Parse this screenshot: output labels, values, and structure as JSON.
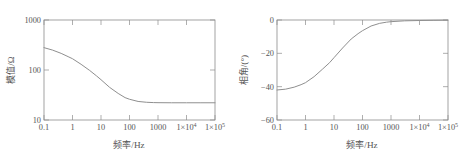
{
  "figure": {
    "background_color": "#ffffff",
    "line_color": "#8f8f8f",
    "axis_color": "#8c8c8c",
    "text_color": "#555555"
  },
  "panels": [
    {
      "id": "magnitude",
      "xlabel_cjk": "频率",
      "xlabel_unit": "/Hz",
      "ylabel_cjk": "模值",
      "ylabel_unit": "/Ω",
      "x_ticks": [
        "0.1",
        "1",
        "10",
        "100",
        "1000",
        "1×10",
        "1×10"
      ],
      "x_tick_sups": [
        "",
        "",
        "",
        "",
        "",
        "4",
        "5"
      ],
      "y_ticks": [
        "1000",
        "100",
        "10"
      ]
    },
    {
      "id": "phase",
      "xlabel_cjk": "频率",
      "xlabel_unit": "/Hz",
      "ylabel_cjk": "相角",
      "ylabel_unit": "/(°)",
      "x_ticks": [
        "0.1",
        "1",
        "10",
        "100",
        "1000",
        "1×10",
        "1×10"
      ],
      "x_tick_sups": [
        "",
        "",
        "",
        "",
        "",
        "4",
        "5"
      ],
      "y_ticks": [
        "0",
        "−20",
        "−40",
        "−60"
      ]
    }
  ],
  "chart_data": [
    {
      "type": "line",
      "id": "magnitude-bode",
      "title": "",
      "xlabel": "频率/Hz",
      "ylabel": "模值/Ω",
      "xscale": "log",
      "yscale": "log",
      "xlim": [
        0.1,
        100000
      ],
      "ylim": [
        10,
        1000
      ],
      "xticks": [
        0.1,
        1,
        10,
        100,
        1000,
        10000,
        100000
      ],
      "xticklabels": [
        "0.1",
        "1",
        "10",
        "100",
        "1000",
        "1×10⁴",
        "1×10⁵"
      ],
      "yticks": [
        10,
        100,
        1000
      ],
      "yticklabels": [
        "10",
        "100",
        "10"
      ],
      "grid": false,
      "legend": null,
      "x": [
        0.1,
        0.2,
        0.4,
        0.7,
        1,
        2,
        4,
        7,
        10,
        20,
        40,
        70,
        100,
        200,
        400,
        700,
        1000,
        3000,
        10000,
        30000,
        100000
      ],
      "y": [
        280,
        250,
        215,
        185,
        168,
        130,
        98,
        76,
        64,
        45,
        34,
        28,
        26,
        23.5,
        22.6,
        22.3,
        22.2,
        22.1,
        22.1,
        22.1,
        22.1
      ]
    },
    {
      "type": "line",
      "id": "phase-bode",
      "title": "",
      "xlabel": "频率/Hz",
      "ylabel": "相角/(°)",
      "xscale": "log",
      "yscale": "linear",
      "xlim": [
        0.1,
        100000
      ],
      "ylim": [
        -60,
        0
      ],
      "xticks": [
        0.1,
        1,
        10,
        100,
        1000,
        10000,
        100000
      ],
      "xticklabels": [
        "0.1",
        "1",
        "10",
        "100",
        "1000",
        "1×10⁴",
        "1×10⁵"
      ],
      "yticks": [
        0,
        -20,
        -40,
        -60
      ],
      "yticklabels": [
        "0",
        "−20",
        "−40",
        "−60"
      ],
      "grid": false,
      "legend": null,
      "x": [
        0.1,
        0.2,
        0.4,
        0.7,
        1,
        2,
        4,
        7,
        10,
        20,
        40,
        70,
        100,
        200,
        400,
        700,
        1000,
        3000,
        10000,
        30000,
        100000
      ],
      "y": [
        -42.0,
        -41.5,
        -40.3,
        -38.8,
        -37.6,
        -34.0,
        -29.4,
        -25.6,
        -22.6,
        -16.8,
        -11.4,
        -8.2,
        -6.4,
        -3.6,
        -2.0,
        -1.3,
        -1.0,
        -0.5,
        -0.3,
        -0.2,
        -0.1
      ]
    }
  ]
}
